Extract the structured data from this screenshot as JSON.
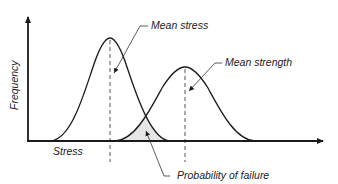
{
  "diagram": {
    "type": "stress-strength interference",
    "y_axis_label": "Frequency",
    "x_axis_label": "Stress",
    "annotations": {
      "mean_stress": "Mean stress",
      "mean_strength": "Mean strength",
      "probability_of_failure": "Probability of failure"
    },
    "curves": [
      {
        "name": "stress distribution",
        "start_x": 50,
        "peak_x": 110,
        "peak_y": 38,
        "end_x": 170
      },
      {
        "name": "strength distribution",
        "start_x": 115,
        "peak_x": 185,
        "peak_y": 67,
        "end_x": 255
      }
    ],
    "colors": {
      "line": "#1a1a1a",
      "overlap_fill": "#e6e6e6",
      "background": "#ffffff"
    }
  }
}
